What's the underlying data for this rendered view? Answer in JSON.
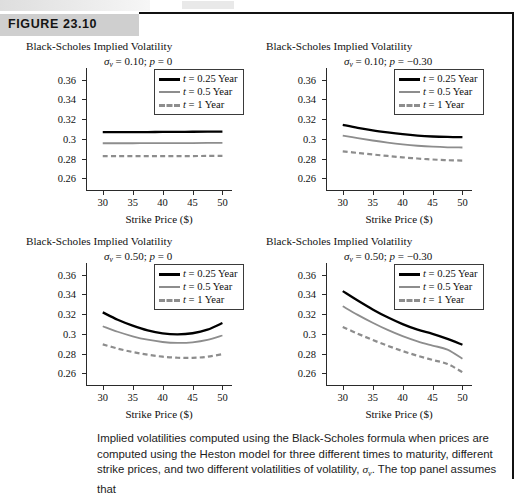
{
  "figure": {
    "label": "FIGURE 23.10",
    "caption": "Implied volatilities computed using the Black-Scholes formula when prices are computed using the Heston model for three different times to maturity, different strike prices, and two different volatilities of volatility,",
    "caption_symbol": "σ",
    "caption_symbol_sub": "v",
    "caption_tail": ". The top panel assumes that"
  },
  "legend": {
    "items": [
      {
        "label_italic": "t",
        "label_rest": " = 0.25 Year",
        "style": "solid-black",
        "color": "#000000"
      },
      {
        "label_italic": "t",
        "label_rest": " = 0.5 Year",
        "style": "solid-gray",
        "color": "#8d8d8d"
      },
      {
        "label_italic": "t",
        "label_rest": " = 1 Year",
        "style": "dash-gray",
        "color": "#8d8d8d"
      }
    ]
  },
  "axes": {
    "ylabel_top": "Black-Scholes Implied Volatility",
    "xlabel": "Strike Price ($)",
    "yticks": [
      "0.36",
      "0.34",
      "0.32",
      "0.3",
      "0.28",
      "0.26"
    ],
    "ytick_values": [
      0.36,
      0.34,
      0.32,
      0.3,
      0.28,
      0.26
    ],
    "xticks": [
      "30",
      "35",
      "40",
      "45",
      "50"
    ],
    "xtick_values": [
      30,
      35,
      40,
      45,
      50
    ],
    "ylim": [
      0.248,
      0.372
    ],
    "xlim": [
      27.2,
      51.6
    ]
  },
  "chart_data": [
    {
      "id": "top-left",
      "type": "line",
      "title": "Black-Scholes Implied Volatility",
      "subtitle_sigma": "σ",
      "subtitle_sub": "v",
      "subtitle_rest": " = 0.10; ",
      "subtitle_rho": "p",
      "subtitle_rho_val": " = 0",
      "xlabel": "Strike Price ($)",
      "ylabel": "Black-Scholes Implied Volatility",
      "xlim": [
        27.2,
        51.6
      ],
      "ylim": [
        0.248,
        0.372
      ],
      "grid": false,
      "legend_position": "top-right",
      "x": [
        30,
        32.5,
        35,
        37.5,
        40,
        42.5,
        45,
        47.5,
        50
      ],
      "series": [
        {
          "name": "t = 0.25 Year",
          "values": [
            0.3068,
            0.3068,
            0.3069,
            0.3069,
            0.307,
            0.3071,
            0.3072,
            0.3073,
            0.3074
          ]
        },
        {
          "name": "t = 0.5 Year",
          "values": [
            0.2955,
            0.2955,
            0.2955,
            0.2956,
            0.2956,
            0.2957,
            0.2957,
            0.2958,
            0.2958
          ]
        },
        {
          "name": "t = 1 Year",
          "values": [
            0.2824,
            0.2824,
            0.2824,
            0.2824,
            0.2825,
            0.2825,
            0.2825,
            0.2826,
            0.2826
          ]
        }
      ]
    },
    {
      "id": "top-right",
      "type": "line",
      "title": "Black-Scholes Implied Volatility",
      "subtitle_sigma": "σ",
      "subtitle_sub": "v",
      "subtitle_rest": " = 0.10; ",
      "subtitle_rho": "p",
      "subtitle_rho_val": " = −0.30",
      "xlabel": "Strike Price ($)",
      "ylabel": "Black-Scholes Implied Volatility",
      "xlim": [
        27.2,
        51.6
      ],
      "ylim": [
        0.248,
        0.372
      ],
      "grid": false,
      "legend_position": "top-right",
      "x": [
        30,
        32.5,
        35,
        37.5,
        40,
        42.5,
        45,
        47.5,
        50
      ],
      "series": [
        {
          "name": "t = 0.25 Year",
          "values": [
            0.3143,
            0.3112,
            0.3086,
            0.3065,
            0.3047,
            0.3033,
            0.3024,
            0.3019,
            0.3017
          ]
        },
        {
          "name": "t = 0.5 Year",
          "values": [
            0.3033,
            0.3007,
            0.2983,
            0.2962,
            0.2944,
            0.293,
            0.292,
            0.2914,
            0.2912
          ]
        },
        {
          "name": "t = 1 Year",
          "values": [
            0.2873,
            0.2857,
            0.2841,
            0.2826,
            0.2812,
            0.28,
            0.279,
            0.2783,
            0.2779
          ]
        }
      ]
    },
    {
      "id": "bottom-left",
      "type": "line",
      "title": "Black-Scholes Implied Volatility",
      "subtitle_sigma": "σ",
      "subtitle_sub": "v",
      "subtitle_rest": " = 0.50; ",
      "subtitle_rho": "p",
      "subtitle_rho_val": " = 0",
      "xlabel": "Strike Price ($)",
      "ylabel": "Black-Scholes Implied Volatility",
      "xlim": [
        27.2,
        51.6
      ],
      "ylim": [
        0.248,
        0.372
      ],
      "grid": false,
      "legend_position": "top-right",
      "x": [
        30,
        32.5,
        35,
        37.5,
        40,
        42.5,
        45,
        47.5,
        50
      ],
      "series": [
        {
          "name": "t = 0.25 Year",
          "values": [
            0.3218,
            0.3143,
            0.3083,
            0.3035,
            0.3005,
            0.2995,
            0.3006,
            0.3042,
            0.311
          ]
        },
        {
          "name": "t = 0.5 Year",
          "values": [
            0.3077,
            0.3021,
            0.2975,
            0.294,
            0.2917,
            0.2908,
            0.2914,
            0.2938,
            0.2983
          ]
        },
        {
          "name": "t = 1 Year",
          "values": [
            0.2893,
            0.285,
            0.2815,
            0.2788,
            0.2768,
            0.2757,
            0.2756,
            0.2767,
            0.2794
          ]
        }
      ]
    },
    {
      "id": "bottom-right",
      "type": "line",
      "title": "Black-Scholes Implied Volatility",
      "subtitle_sigma": "σ",
      "subtitle_sub": "v",
      "subtitle_rest": " = 0.50; ",
      "subtitle_rho": "p",
      "subtitle_rho_val": " = −0.30",
      "xlabel": "Strike Price ($)",
      "ylabel": "Black-Scholes Implied Volatility",
      "xlim": [
        27.2,
        51.6
      ],
      "ylim": [
        0.248,
        0.372
      ],
      "grid": false,
      "legend_position": "top-right",
      "x": [
        30,
        32.5,
        35,
        37.5,
        40,
        42.5,
        45,
        47.5,
        50
      ],
      "series": [
        {
          "name": "t = 0.25 Year",
          "values": [
            0.3434,
            0.3338,
            0.3248,
            0.3168,
            0.3099,
            0.3042,
            0.3,
            0.2949,
            0.2889
          ]
        },
        {
          "name": "t = 0.5 Year",
          "values": [
            0.328,
            0.3193,
            0.3113,
            0.304,
            0.2977,
            0.2924,
            0.2881,
            0.284,
            0.2747
          ]
        },
        {
          "name": "t = 1 Year",
          "values": [
            0.307,
            0.3002,
            0.2938,
            0.2879,
            0.2825,
            0.2777,
            0.2735,
            0.2694,
            0.261
          ]
        }
      ]
    }
  ]
}
